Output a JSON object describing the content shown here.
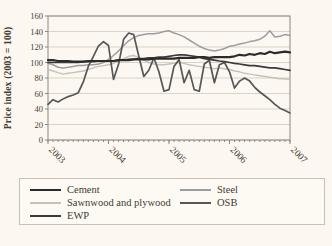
{
  "chart_data": {
    "type": "line",
    "title": "",
    "ylabel": "Price index (2003 = 100)",
    "ylim": [
      0,
      160
    ],
    "ytick_step": 20,
    "yticks": [
      0,
      20,
      40,
      60,
      80,
      100,
      120,
      140,
      160
    ],
    "x_unit": "month",
    "x_start": "2003-01",
    "x_end": "2007-01",
    "xtick_labels": [
      "2003",
      "2004",
      "2005",
      "2006",
      "2007"
    ],
    "xtick_month_index": [
      0,
      12,
      24,
      36,
      48
    ],
    "grid": "horizontal",
    "legend_position": "bottom",
    "legend_order": [
      0,
      1,
      2,
      3,
      4
    ],
    "draw_order": [
      2,
      1,
      3,
      4,
      0
    ],
    "series": [
      {
        "name": "Cement",
        "color": "#2b2b2b",
        "width": 2.2,
        "values": [
          103,
          103,
          102,
          102,
          102,
          101,
          101,
          101,
          102,
          102,
          102,
          102,
          102,
          102,
          103,
          103,
          103,
          104,
          104,
          104,
          104,
          105,
          105,
          105,
          105,
          105,
          106,
          106,
          106,
          106,
          107,
          107,
          106,
          107,
          107,
          107,
          107,
          108,
          110,
          109,
          111,
          110,
          112,
          111,
          114,
          112,
          113,
          114,
          113
        ]
      },
      {
        "name": "Steel",
        "color": "#9d9d9d",
        "width": 1.5,
        "values": [
          99,
          97,
          94,
          93,
          94,
          95,
          96,
          96,
          97,
          97,
          98,
          100,
          104,
          109,
          115,
          122,
          128,
          132,
          135,
          136,
          137,
          137,
          138,
          140,
          141,
          138,
          136,
          133,
          129,
          125,
          121,
          118,
          116,
          115,
          116,
          118,
          121,
          122,
          124,
          125,
          127,
          128,
          130,
          134,
          141,
          133,
          134,
          136,
          135
        ]
      },
      {
        "name": "Sawnwood and plywood",
        "color": "#c6c2ba",
        "width": 1.4,
        "values": [
          91,
          89,
          87,
          85,
          86,
          87,
          88,
          89,
          91,
          93,
          95,
          96,
          97,
          99,
          102,
          105,
          108,
          109,
          106,
          103,
          100,
          98,
          97,
          97,
          98,
          99,
          100,
          99,
          97,
          96,
          95,
          94,
          93,
          92,
          93,
          92,
          91,
          89,
          88,
          86,
          85,
          84,
          83,
          82,
          81,
          80,
          79,
          79,
          78
        ]
      },
      {
        "name": "OSB",
        "color": "#565656",
        "width": 1.7,
        "values": [
          46,
          52,
          49,
          53,
          56,
          58,
          61,
          75,
          95,
          108,
          121,
          127,
          122,
          78,
          98,
          130,
          138,
          136,
          108,
          82,
          90,
          106,
          88,
          63,
          65,
          95,
          104,
          74,
          90,
          65,
          63,
          98,
          103,
          74,
          97,
          100,
          88,
          67,
          76,
          80,
          76,
          68,
          62,
          57,
          52,
          46,
          41,
          38,
          35
        ]
      },
      {
        "name": "EWP",
        "color": "#3a3a3a",
        "width": 1.7,
        "values": [
          100,
          100,
          100,
          100,
          100,
          100,
          100,
          101,
          101,
          101,
          102,
          102,
          102,
          102,
          103,
          103,
          104,
          104,
          105,
          105,
          106,
          106,
          107,
          107,
          108,
          109,
          110,
          110,
          109,
          108,
          107,
          105,
          104,
          103,
          102,
          101,
          100,
          99,
          98,
          97,
          96,
          96,
          95,
          94,
          93,
          93,
          92,
          91,
          90
        ]
      }
    ]
  }
}
